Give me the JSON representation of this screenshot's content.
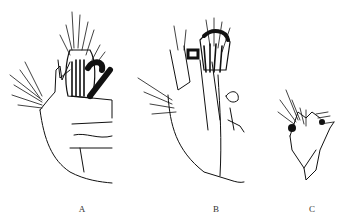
{
  "figure": {
    "panels": [
      {
        "id": "A",
        "label": "A",
        "description": "Line drawing of specimen structure with dense setae, lateral view"
      },
      {
        "id": "B",
        "label": "B",
        "description": "Line drawing of specimen structure with dense setae and branched appendage"
      },
      {
        "id": "C",
        "label": "C",
        "description": "Smaller line drawing of appendage with setae"
      }
    ],
    "colors": {
      "ink": "#111111",
      "background": "#ffffff"
    }
  }
}
